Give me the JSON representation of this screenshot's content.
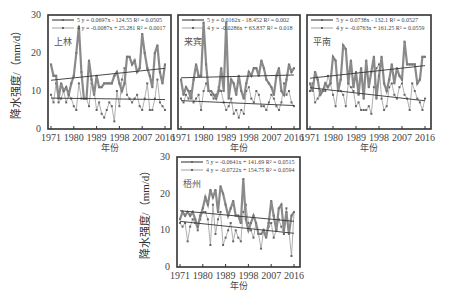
{
  "chart_data": [
    {
      "type": "line",
      "station": "上林",
      "xlabel": "年份",
      "ylabel": "降水强度/（mm/d）",
      "ylim": [
        0,
        30
      ],
      "yticks": [
        0,
        10,
        20,
        30
      ],
      "xlim": [
        1971,
        2016
      ],
      "xticks": [
        1971,
        1980,
        1989,
        1998,
        2007,
        2016
      ],
      "legend": [
        {
          "series": "5",
          "equation": "y = 0.0697x - 124.55",
          "r2": "R² = 0.0505"
        },
        {
          "series": "4",
          "equation": "y = -0.0087x + 25.281",
          "r2": "R² = 0.0017"
        }
      ],
      "series": [
        {
          "name": "5",
          "trend": {
            "slope": 0.0697,
            "intercept": -124.55
          },
          "values": [
            17,
            14,
            14,
            8,
            12,
            10,
            11,
            9,
            12,
            14,
            20,
            27,
            15,
            8,
            8,
            18,
            13,
            9,
            14,
            11,
            11,
            12,
            12,
            12,
            12,
            14,
            15,
            12,
            10,
            12,
            19,
            19,
            17,
            18,
            15,
            16,
            25,
            20,
            16,
            14,
            11,
            20,
            22,
            15,
            12,
            17
          ]
        },
        {
          "name": "4",
          "trend": {
            "slope": -0.0087,
            "intercept": 25.281
          },
          "values": [
            9,
            7,
            12,
            7,
            8,
            10,
            7,
            9,
            8,
            6,
            5,
            12,
            8,
            8,
            8,
            6,
            12,
            10,
            5,
            7,
            4,
            3,
            5,
            7,
            6,
            2,
            10,
            6,
            13,
            16,
            9,
            8,
            7,
            8,
            9,
            6,
            5,
            8,
            12,
            5,
            5,
            8,
            13,
            7,
            6,
            5
          ]
        }
      ]
    },
    {
      "type": "line",
      "station": "来宾",
      "xlabel": "年份",
      "ylabel": "",
      "ylim": [
        0,
        30
      ],
      "xlim": [
        1971,
        2016
      ],
      "xticks": [
        1971,
        1980,
        1989,
        1998,
        2007,
        2016
      ],
      "legend": [
        {
          "series": "5",
          "equation": "y = 0.0162x - 18.452",
          "r2": "R² = 0.002"
        },
        {
          "series": "4",
          "equation": "y = -0.0286x + 63.837",
          "r2": "R² = 0.018"
        }
      ],
      "series": [
        {
          "name": "5",
          "trend": {
            "slope": 0.0162,
            "intercept": -18.452
          },
          "values": [
            13,
            9,
            11,
            10,
            8,
            13,
            17,
            14,
            14,
            28,
            17,
            10,
            10,
            9,
            8,
            10,
            16,
            10,
            28,
            8,
            13,
            12,
            9,
            14,
            10,
            8,
            12,
            15,
            14,
            16,
            16,
            14,
            18,
            16,
            13,
            12,
            11,
            9,
            14,
            16,
            10,
            9,
            13,
            17,
            15,
            16
          ]
        },
        {
          "name": "4",
          "trend": {
            "slope": -0.0286,
            "intercept": 63.837
          },
          "values": [
            8,
            7,
            9,
            8,
            10,
            7,
            8,
            9,
            5,
            10,
            12,
            10,
            9,
            8,
            9,
            11,
            10,
            7,
            5,
            6,
            8,
            4,
            5,
            3,
            5,
            4,
            10,
            11,
            8,
            7,
            10,
            9,
            6,
            6,
            5,
            7,
            9,
            8,
            6,
            5,
            7,
            12,
            9,
            10,
            7,
            6
          ]
        }
      ]
    },
    {
      "type": "line",
      "station": "平南",
      "xlabel": "年份",
      "ylabel": "",
      "ylim": [
        0,
        30
      ],
      "xlim": [
        1971,
        2016
      ],
      "xticks": [
        1971,
        1980,
        1989,
        1998,
        2007,
        2016
      ],
      "legend": [
        {
          "series": "5",
          "equation": "y = 0.0738x - 132.1",
          "r2": "R² = 0.0527"
        },
        {
          "series": "4",
          "equation": "y = -0.0763x + 161.25",
          "r2": "R² = 0.0559"
        }
      ],
      "series": [
        {
          "name": "5",
          "trend": {
            "slope": 0.0738,
            "intercept": -132.1
          },
          "values": [
            12,
            10,
            15,
            13,
            9,
            10,
            12,
            11,
            12,
            19,
            18,
            10,
            13,
            22,
            21,
            12,
            18,
            11,
            15,
            9,
            16,
            8,
            18,
            11,
            15,
            19,
            8,
            14,
            19,
            12,
            10,
            13,
            17,
            12,
            16,
            14,
            13,
            23,
            17,
            17,
            17,
            17,
            12,
            13,
            19,
            19
          ]
        },
        {
          "name": "4",
          "trend": {
            "slope": -0.0763,
            "intercept": 161.25
          },
          "values": [
            10,
            12,
            7,
            8,
            10,
            10,
            10,
            14,
            12,
            9,
            6,
            11,
            10,
            9,
            6,
            12,
            11,
            10,
            6,
            7,
            5,
            5,
            5,
            6,
            4,
            11,
            16,
            17,
            8,
            5,
            6,
            11,
            12,
            9,
            8,
            11,
            12,
            9,
            8,
            5,
            12,
            10,
            8,
            7,
            5,
            8
          ]
        }
      ]
    },
    {
      "type": "line",
      "station": "梧州",
      "xlabel": "年份",
      "ylabel": "降水强度/（mm/d）",
      "ylim": [
        0,
        30
      ],
      "yticks": [
        0,
        10,
        20,
        30
      ],
      "xlim": [
        1971,
        2016
      ],
      "xticks": [
        1971,
        1980,
        1989,
        1998,
        2007,
        2016
      ],
      "legend": [
        {
          "series": "5",
          "equation": "y = -0.0641x + 141.69",
          "r2": "R² = 0.0515"
        },
        {
          "series": "4",
          "equation": "y = -0.0722x + 154.75",
          "r2": "R² = 0.0594"
        }
      ],
      "series": [
        {
          "name": "5",
          "trend": {
            "slope": -0.0641,
            "intercept": 141.69
          },
          "values": [
            13,
            15,
            14,
            15,
            14,
            15,
            13,
            11,
            14,
            16,
            19,
            17,
            21,
            19,
            21,
            15,
            22,
            20,
            17,
            14,
            16,
            18,
            14,
            14,
            12,
            24,
            13,
            10,
            12,
            14,
            12,
            9,
            9,
            10,
            8,
            12,
            18,
            14,
            10,
            16,
            17,
            10,
            15,
            9,
            14,
            15
          ]
        },
        {
          "name": "4",
          "trend": {
            "slope": -0.0722,
            "intercept": 154.75
          },
          "values": [
            12,
            11,
            12,
            7,
            11,
            13,
            12,
            10,
            13,
            15,
            15,
            13,
            6,
            17,
            9,
            13,
            15,
            6,
            8,
            10,
            12,
            7,
            10,
            8,
            7,
            15,
            17,
            12,
            10,
            8,
            12,
            9,
            5,
            10,
            9,
            11,
            12,
            8,
            10,
            13,
            11,
            9,
            16,
            10,
            3,
            15
          ]
        }
      ]
    }
  ],
  "labels": {
    "ytitle": "降水强度/（mm/d）",
    "xtitle": "年份"
  }
}
